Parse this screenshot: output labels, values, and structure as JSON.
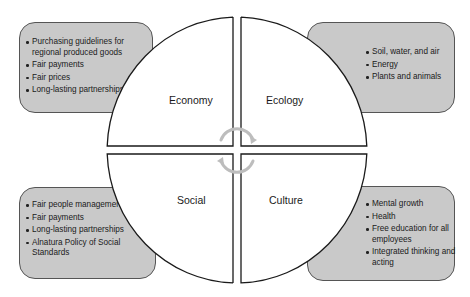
{
  "diagram": {
    "type": "four-quadrant sustainability wheel",
    "quadrants": [
      {
        "id": "economy",
        "label": "Economy",
        "position": "top-left",
        "items": [
          "Purchasing guidelines for regional produced goods",
          "Fair payments",
          "Fair prices",
          "Long-lasting partnerships"
        ]
      },
      {
        "id": "ecology",
        "label": "Ecology",
        "position": "top-right",
        "items": [
          "Soil, water, and air",
          "Energy",
          "Plants and animals"
        ]
      },
      {
        "id": "social",
        "label": "Social",
        "position": "bottom-left",
        "items": [
          "Fair people management",
          "Fair payments",
          "Long-lasting partnerships",
          "Alnatura Policy of Social Standards"
        ]
      },
      {
        "id": "culture",
        "label": "Culture",
        "position": "bottom-right",
        "items": [
          "Mental growth",
          "Health",
          "Free education for all employees",
          "Integrated thinking and acting"
        ]
      }
    ],
    "center_icon": "circular-arrows-icon",
    "colors": {
      "box_fill": "#c9c9c9",
      "box_border": "#555555",
      "wheel_fill": "#ffffff",
      "wheel_stroke": "#1a1a1a",
      "center_arrows": "#bdbdbd"
    }
  }
}
